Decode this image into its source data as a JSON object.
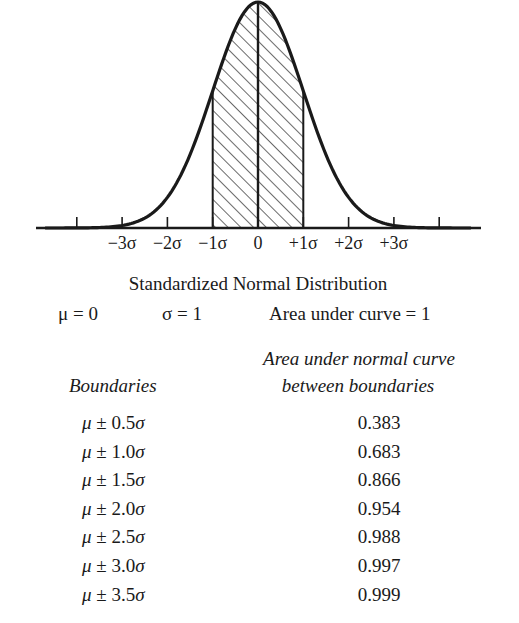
{
  "chart_data": {
    "type": "area",
    "title": "Standardized Normal Distribution",
    "mean": 0,
    "std_dev": 1,
    "total_area": 1,
    "shaded_region": [
      -1,
      1
    ],
    "x_tick_positions": [
      -4,
      -3,
      -2,
      -1,
      0,
      1,
      2,
      3,
      4
    ],
    "x_tick_labels": [
      {
        "x": -3,
        "label": "−3σ"
      },
      {
        "x": -2,
        "label": "−2σ"
      },
      {
        "x": -1,
        "label": "−1σ"
      },
      {
        "x": 0,
        "label": "0"
      },
      {
        "x": 1,
        "label": "+1σ"
      },
      {
        "x": 2,
        "label": "+2σ"
      },
      {
        "x": 3,
        "label": "+3σ"
      }
    ],
    "table": {
      "columns": [
        "Boundaries",
        "Area under normal curve between boundaries"
      ],
      "rows": [
        {
          "k": 0.5,
          "boundary": "μ ± 0.5σ",
          "area": 0.383
        },
        {
          "k": 1.0,
          "boundary": "μ ± 1.0σ",
          "area": 0.683
        },
        {
          "k": 1.5,
          "boundary": "μ ± 1.5σ",
          "area": 0.866
        },
        {
          "k": 2.0,
          "boundary": "μ ± 2.0σ",
          "area": 0.954
        },
        {
          "k": 2.5,
          "boundary": "μ ± 2.5σ",
          "area": 0.988
        },
        {
          "k": 3.0,
          "boundary": "μ ± 3.0σ",
          "area": 0.997
        },
        {
          "k": 3.5,
          "boundary": "μ ± 3.5σ",
          "area": 0.999
        }
      ]
    }
  },
  "caption": {
    "title": "Standardized Normal Distribution",
    "mu": "μ = 0",
    "sigma": "σ = 1",
    "area": "Area under curve = 1"
  },
  "table_header": {
    "boundaries": "Boundaries",
    "area_line1": "Area under normal curve",
    "area_line2": "between boundaries"
  },
  "colors": {
    "ink": "#1a1a1a",
    "background": "#ffffff"
  }
}
